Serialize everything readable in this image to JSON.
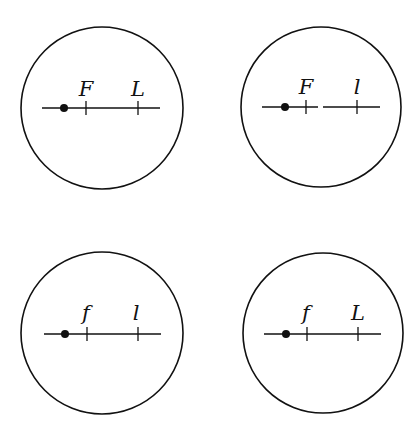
{
  "diagram": {
    "stroke_color": "#111111",
    "background": "#ffffff",
    "panels": [
      {
        "id": "top-left",
        "circle": {
          "cx": 102,
          "cy": 108,
          "r": 81
        },
        "axis": {
          "y": 108,
          "x1": 42,
          "x2": 160,
          "gap": null
        },
        "dot_x": 64,
        "ticks": [
          {
            "x": 86,
            "label": "F"
          },
          {
            "x": 138,
            "label": "L"
          }
        ]
      },
      {
        "id": "top-right",
        "circle": {
          "cx": 321,
          "cy": 107,
          "r": 80
        },
        "axis": {
          "y": 107,
          "x1": 262,
          "x2": 380,
          "gap": [
            318,
            323
          ]
        },
        "dot_x": 285,
        "ticks": [
          {
            "x": 306,
            "label": "F"
          },
          {
            "x": 357,
            "label": "l"
          }
        ]
      },
      {
        "id": "bottom-left",
        "circle": {
          "cx": 102,
          "cy": 333,
          "r": 81
        },
        "axis": {
          "y": 334,
          "x1": 44,
          "x2": 161,
          "gap": null
        },
        "dot_x": 65,
        "ticks": [
          {
            "x": 87,
            "label": "f"
          },
          {
            "x": 138,
            "label": "l"
          }
        ]
      },
      {
        "id": "bottom-right",
        "circle": {
          "cx": 323,
          "cy": 333,
          "r": 80
        },
        "axis": {
          "y": 334,
          "x1": 264,
          "x2": 381,
          "gap": null
        },
        "dot_x": 286,
        "ticks": [
          {
            "x": 307,
            "label": "f"
          },
          {
            "x": 358,
            "label": "L"
          }
        ]
      }
    ]
  }
}
